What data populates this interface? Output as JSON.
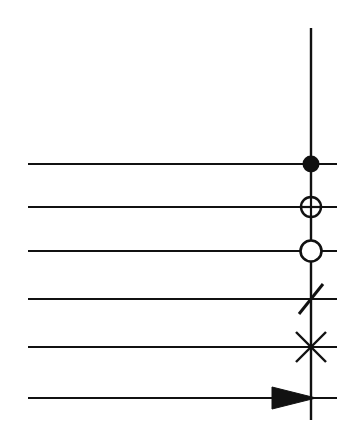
{
  "figure": {
    "background_color": "#ffffff",
    "stroke_color": "#111111",
    "width": 362,
    "height": 446
  },
  "axis": {
    "name": "vertical-axis-line",
    "x": 311,
    "y_top": 28,
    "y_bottom": 420,
    "stroke_width": 2.4
  },
  "rows": [
    {
      "index": 1,
      "marker": "filled-circle",
      "marker_label": "filled circle",
      "line_x_start": 28,
      "line_x_end": 337,
      "y": 164,
      "stroke_width": 2.2,
      "marker_radius": 7.5,
      "marker_fill": "#111111"
    },
    {
      "index": 2,
      "marker": "crossed-circle",
      "marker_label": "circle with cross",
      "line_x_start": 28,
      "line_x_end": 337,
      "y": 207,
      "stroke_width": 2.2,
      "marker_radius": 10,
      "marker_fill": "#ffffff"
    },
    {
      "index": 3,
      "marker": "open-circle",
      "marker_label": "open circle",
      "line_x_start": 28,
      "line_x_end": 337,
      "y": 251,
      "stroke_width": 2.2,
      "marker_radius": 10.5,
      "marker_fill": "#ffffff"
    },
    {
      "index": 4,
      "marker": "diagonal-slash",
      "marker_label": "single diagonal slash",
      "line_x_start": 28,
      "line_x_end": 337,
      "y": 299,
      "stroke_width": 2.2,
      "marker_radius": 16,
      "marker_fill": "none"
    },
    {
      "index": 5,
      "marker": "diagonal-cross",
      "marker_label": "diagonal cross (X)",
      "line_x_start": 28,
      "line_x_end": 337,
      "y": 347,
      "stroke_width": 2.2,
      "marker_radius": 21,
      "marker_fill": "none"
    },
    {
      "index": 6,
      "marker": "filled-arrowhead",
      "marker_label": "filled arrowhead pointing right",
      "line_x_start": 28,
      "line_x_end": 337,
      "y": 398,
      "stroke_width": 2.2,
      "marker_radius": 0,
      "marker_fill": "#111111"
    }
  ],
  "chart_data": {
    "type": "diagram",
    "title": "",
    "xlabel": "",
    "ylabel": "",
    "axis_x_position": 311,
    "marker_sequence": [
      "filled-circle",
      "crossed-circle",
      "open-circle",
      "diagonal-slash",
      "diagonal-cross",
      "filled-arrowhead"
    ],
    "row_y_positions": [
      164,
      207,
      251,
      299,
      347,
      398
    ],
    "line_x_range": [
      28,
      337
    ],
    "grid": false,
    "legend": "none"
  }
}
